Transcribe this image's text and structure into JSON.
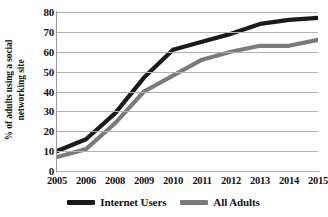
{
  "chart_data": {
    "type": "line",
    "title": "",
    "subtitle": "",
    "xlabel": "",
    "ylabel": "% of adults using a social networking site",
    "ylabel_line1": "% of adults using a social",
    "ylabel_line2": "networking site",
    "categories": [
      "2005",
      "2006",
      "2008",
      "2009",
      "2010",
      "2011",
      "2012",
      "2013",
      "2014",
      "2015"
    ],
    "xlim": [
      2005,
      2015
    ],
    "ylim": [
      0,
      80
    ],
    "ytick_values": [
      0,
      10,
      20,
      30,
      40,
      50,
      60,
      70,
      80
    ],
    "ytick_labels": [
      "0",
      "10",
      "20",
      "30",
      "40",
      "50",
      "60",
      "70",
      "80"
    ],
    "grid": true,
    "grid_axis": "y",
    "legend_position": "bottom",
    "series": [
      {
        "name": "Internet Users",
        "color": "#1a1a1a",
        "values": [
          10,
          16,
          29,
          47,
          61,
          65,
          69,
          74,
          76,
          77
        ]
      },
      {
        "name": "All Adults",
        "color": "#7b7b7b",
        "values": [
          7,
          11,
          24,
          40,
          48,
          56,
          60,
          63,
          63,
          66
        ]
      }
    ],
    "annotations": []
  },
  "legend": {
    "entries": [
      {
        "label": "Internet Users",
        "color": "#1a1a1a"
      },
      {
        "label": "All Adults",
        "color": "#7b7b7b"
      }
    ]
  },
  "colors": {
    "internet_users": "#1a1a1a",
    "all_adults": "#7b7b7b",
    "gridline": "#b0b0b0",
    "axis": "#9a9a9a",
    "text": "#111111",
    "background": "#ffffff"
  }
}
